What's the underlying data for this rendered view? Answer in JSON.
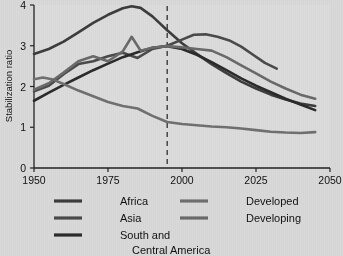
{
  "chart_data": {
    "type": "line",
    "title": "",
    "xlabel": "",
    "ylabel": "Stabilization ratio",
    "xlim": [
      1950,
      2050
    ],
    "ylim": [
      0,
      4
    ],
    "xticks": [
      1950,
      1975,
      2000,
      2025,
      2050
    ],
    "xtick_labels": [
      "1950",
      "1975",
      "2000",
      "2025",
      "2050"
    ],
    "yticks": [
      0,
      1,
      2,
      3,
      4
    ],
    "ytick_labels": [
      "0",
      "1",
      "2",
      "3",
      "4"
    ],
    "grid": false,
    "legend_position": "below",
    "annotations": [
      {
        "name": "projection-divider",
        "type": "vertical-dashed-line",
        "x": 1995,
        "color": "#3a3a3a"
      }
    ],
    "series": [
      {
        "name": "Africa",
        "color": "#3d3d3d",
        "width": 2.6,
        "x": [
          1950,
          1955,
          1960,
          1965,
          1970,
          1975,
          1980,
          1983,
          1986,
          1990,
          1995,
          2000,
          2005,
          2010,
          2015,
          2020,
          2025,
          2030,
          2035,
          2040,
          2045
        ],
        "y": [
          2.8,
          2.92,
          3.1,
          3.33,
          3.56,
          3.76,
          3.92,
          3.97,
          3.93,
          3.72,
          3.38,
          3.06,
          2.8,
          2.55,
          2.33,
          2.12,
          1.95,
          1.8,
          1.68,
          1.58,
          1.52
        ]
      },
      {
        "name": "Asia",
        "color": "#4a4a4a",
        "width": 2.6,
        "x": [
          1950,
          1955,
          1960,
          1965,
          1970,
          1975,
          1980,
          1985,
          1990,
          1995,
          2000,
          2004,
          2008,
          2012,
          2016,
          2020,
          2024,
          2028,
          2032
        ],
        "y": [
          1.88,
          2.02,
          2.3,
          2.55,
          2.62,
          2.74,
          2.83,
          2.7,
          2.92,
          3.0,
          3.15,
          3.27,
          3.28,
          3.22,
          3.13,
          2.98,
          2.78,
          2.58,
          2.44
        ]
      },
      {
        "name": "South and Central America",
        "color": "#2b2b2b",
        "width": 2.6,
        "x": [
          1950,
          1955,
          1960,
          1965,
          1970,
          1975,
          1980,
          1985,
          1990,
          1995,
          2000,
          2005,
          2010,
          2015,
          2020,
          2025,
          2030,
          2035,
          2040,
          2045
        ],
        "y": [
          1.65,
          1.85,
          2.04,
          2.22,
          2.4,
          2.56,
          2.72,
          2.84,
          2.95,
          2.99,
          2.92,
          2.78,
          2.6,
          2.4,
          2.2,
          2.02,
          1.86,
          1.7,
          1.56,
          1.42
        ]
      },
      {
        "name": "Developed",
        "color": "#707070",
        "width": 2.6,
        "x": [
          1950,
          1953,
          1956,
          1960,
          1965,
          1970,
          1975,
          1980,
          1985,
          1990,
          1995,
          2000,
          2005,
          2010,
          2015,
          2020,
          2025,
          2030,
          2035,
          2040,
          2045
        ],
        "y": [
          2.18,
          2.22,
          2.18,
          2.06,
          1.9,
          1.76,
          1.62,
          1.52,
          1.46,
          1.28,
          1.13,
          1.08,
          1.05,
          1.02,
          1.0,
          0.97,
          0.93,
          0.89,
          0.87,
          0.86,
          0.88
        ]
      },
      {
        "name": "Developing",
        "color": "#6a6a6a",
        "width": 2.6,
        "x": [
          1950,
          1955,
          1960,
          1965,
          1970,
          1975,
          1980,
          1983,
          1986,
          1990,
          1995,
          2000,
          2005,
          2010,
          2015,
          2020,
          2025,
          2030,
          2035,
          2040,
          2045
        ],
        "y": [
          1.92,
          2.08,
          2.34,
          2.62,
          2.74,
          2.62,
          2.86,
          3.22,
          2.88,
          2.95,
          2.99,
          2.96,
          2.92,
          2.88,
          2.72,
          2.52,
          2.32,
          2.12,
          1.95,
          1.8,
          1.7
        ]
      }
    ]
  },
  "axis": {
    "ylabel": "Stabilization ratio"
  },
  "legend": {
    "entries": [
      {
        "label": "Africa",
        "color": "#3d3d3d"
      },
      {
        "label": "Asia",
        "color": "#4a4a4a"
      },
      {
        "label": "South and",
        "label2": "Central America",
        "color": "#2b2b2b"
      },
      {
        "label": "Developed",
        "color": "#707070"
      },
      {
        "label": "Developing",
        "color": "#6a6a6a"
      }
    ]
  }
}
